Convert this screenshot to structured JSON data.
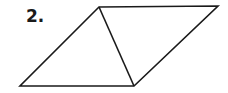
{
  "problem": {
    "number_label": "2."
  },
  "figure": {
    "type": "parallelogram-with-diagonal",
    "stroke_color": "#1a1a1a",
    "vertices": {
      "top_left": [
        99,
        7
      ],
      "top_right": [
        218,
        6
      ],
      "bottom_right": [
        134,
        86
      ],
      "bottom_left": [
        20,
        86
      ]
    }
  }
}
